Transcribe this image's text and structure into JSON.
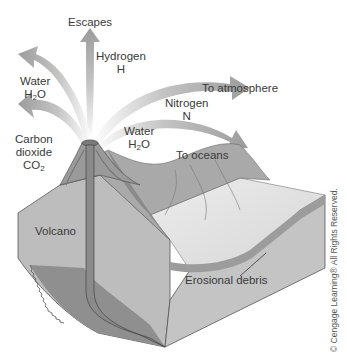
{
  "diagram": {
    "labels": {
      "escapes": "Escapes",
      "hydrogen": {
        "name": "Hydrogen",
        "formula": "H"
      },
      "water_left": {
        "name": "Water",
        "formula_main": "H",
        "formula_sub": "2",
        "formula_end": "O"
      },
      "carbon_dioxide": {
        "line1": "Carbon",
        "line2": "dioxide",
        "formula_main": "CO",
        "formula_sub": "2"
      },
      "to_atmosphere": "To atmosphere",
      "nitrogen": {
        "name": "Nitrogen",
        "formula": "N"
      },
      "water_right": {
        "name": "Water",
        "formula_main": "H",
        "formula_sub": "2",
        "formula_end": "O"
      },
      "to_oceans": "To oceans",
      "volcano": "Volcano",
      "erosional_debris": "Erosional debris"
    },
    "credit": "© Cengage Learning® All Rights Reserved.",
    "colors": {
      "arrow": "#a8a8a8",
      "block_front": "#b9b9b9",
      "block_side": "#c9c9c9",
      "top_surface": "#e2e2e2",
      "magma_conduit": "#8e8e8e",
      "mountain": "#a5a5a5",
      "debris": "#9a9a9a"
    }
  }
}
